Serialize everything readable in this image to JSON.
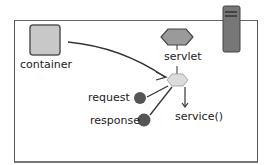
{
  "diagram": {
    "nodes": {
      "container": "container",
      "servlet": "servlet",
      "request": "request",
      "response": "response",
      "service": "service()"
    },
    "colors": {
      "container_fill": "#c8c8c8",
      "servlet_fill": "#9a9a9a",
      "thread_fill": "#dcdcdc",
      "object_fill": "#555555",
      "server_fill": "#777777",
      "line": "#333333"
    }
  }
}
